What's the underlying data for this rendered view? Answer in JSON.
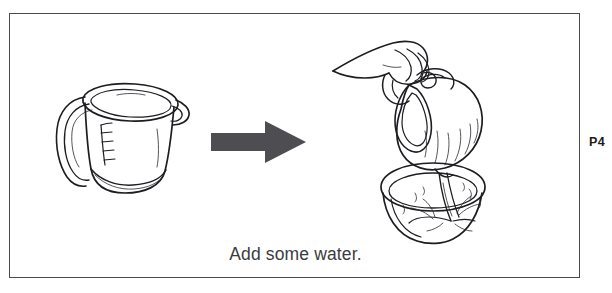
{
  "page": {
    "background_color": "#ffffff",
    "width": 612,
    "height": 293
  },
  "frame": {
    "border_color": "#4a4a4e",
    "fill_color": "#ffffff"
  },
  "illustration": {
    "type": "instructional-line-drawing",
    "steps": [
      {
        "index": 1,
        "name": "measuring-cup",
        "description": "Measuring jug with handle, pouring spout and graduation marks, standing empty."
      },
      {
        "index": 2,
        "name": "process-arrow",
        "description": "Thick right-pointing arrow indicating the next step.",
        "direction": "right",
        "color": "#4d4d52"
      },
      {
        "index": 3,
        "name": "pouring-scene",
        "description": "A hand tilts the jug and pours water, which splashes into a bowl below."
      }
    ]
  },
  "caption": {
    "text": "Add some water.",
    "color": "#3b3b40"
  },
  "page_marker": {
    "label": "P4",
    "color": "#1c1c20"
  }
}
